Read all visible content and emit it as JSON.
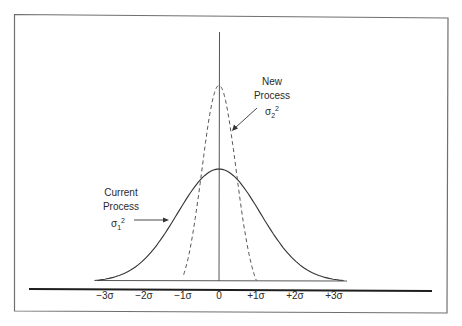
{
  "chart_data": {
    "type": "line",
    "title": "",
    "xlabel": "",
    "ylabel": "",
    "x_ticks": [
      "−3σ",
      "−2σ",
      "−1σ",
      "0",
      "+1σ",
      "+2σ",
      "+3σ"
    ],
    "x_range": [
      -3,
      3
    ],
    "grid": false,
    "legend": "none (inline annotations)",
    "series": [
      {
        "name": "Current Process",
        "variance_label": "σ1²",
        "style": "solid",
        "distribution": "normal",
        "mean": 0,
        "sd_units": 1,
        "x": [
          -3,
          -2.5,
          -2,
          -1.5,
          -1,
          -0.5,
          0,
          0.5,
          1,
          1.5,
          2,
          2.5,
          3
        ],
        "relative_height": [
          0.01,
          0.04,
          0.14,
          0.32,
          0.61,
          0.88,
          1.0,
          0.88,
          0.61,
          0.32,
          0.14,
          0.04,
          0.01
        ]
      },
      {
        "name": "New Process",
        "variance_label": "σ2²",
        "style": "dashed",
        "distribution": "normal",
        "mean": 0,
        "sd_units": 0.33,
        "x": [
          -1,
          -0.5,
          0,
          0.5,
          1
        ],
        "relative_height": [
          0.0,
          0.55,
          1.0,
          0.55,
          0.0
        ],
        "peak_relative_to_current": 1.75
      }
    ],
    "annotations": [
      "Current Process σ1²",
      "New Process σ2²"
    ]
  },
  "labels": {
    "current": {
      "line1": "Current",
      "line2": "Process",
      "sigma": "σ",
      "sub": "1",
      "sup": "2"
    },
    "new": {
      "line1": "New",
      "line2": "Process",
      "sigma": "σ",
      "sub": "2",
      "sup": "2"
    }
  },
  "ticks": [
    "−3σ",
    "−2σ",
    "−1σ",
    "0",
    "+1σ",
    "+2σ",
    "+3σ"
  ],
  "colors": {
    "line": "#333333",
    "frame": "#777777",
    "axis": "#222222"
  }
}
